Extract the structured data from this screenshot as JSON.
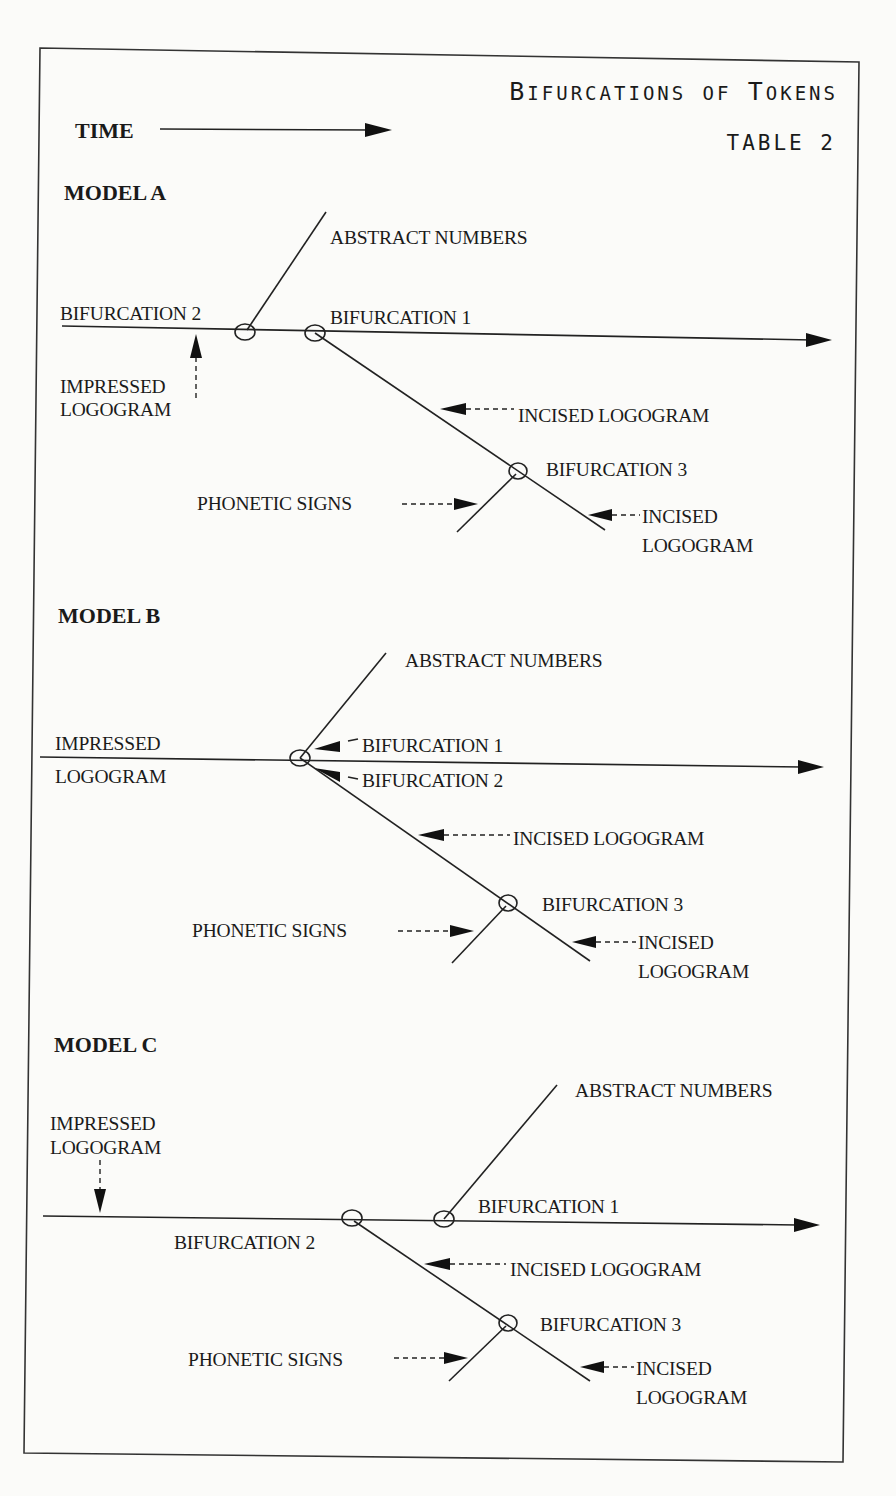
{
  "title": {
    "main": "Bifurcations of Tokens",
    "table": "TABLE 2"
  },
  "time_label": "TIME",
  "colors": {
    "ink": "#1a1a1a",
    "paper": "#fbfbf9"
  },
  "models": [
    {
      "name": "MODEL A",
      "labels": {
        "abstract": "ABSTRACT NUMBERS",
        "bif2": "BIFURCATION 2",
        "bif1": "BIFURCATION 1",
        "impressed_1": "IMPRESSED",
        "impressed_2": "LOGOGRAM",
        "incised": "INCISED LOGOGRAM",
        "bif3": "BIFURCATION 3",
        "phonetic": "PHONETIC SIGNS",
        "incised2_1": "INCISED",
        "incised2_2": "LOGOGRAM"
      }
    },
    {
      "name": "MODEL B",
      "labels": {
        "abstract": "ABSTRACT NUMBERS",
        "impressed_1": "IMPRESSED",
        "impressed_2": "LOGOGRAM",
        "bif1": "BIFURCATION 1",
        "bif2": "BIFURCATION 2",
        "incised": "INCISED LOGOGRAM",
        "bif3": "BIFURCATION 3",
        "phonetic": "PHONETIC SIGNS",
        "incised2_1": "INCISED",
        "incised2_2": "LOGOGRAM"
      }
    },
    {
      "name": "MODEL C",
      "labels": {
        "abstract": "ABSTRACT NUMBERS",
        "impressed_1": "IMPRESSED",
        "impressed_2": "LOGOGRAM",
        "bif1": "BIFURCATION 1",
        "bif2": "BIFURCATION 2",
        "incised": "INCISED LOGOGRAM",
        "bif3": "BIFURCATION 3",
        "phonetic": "PHONETIC SIGNS",
        "incised2_1": "INCISED",
        "incised2_2": "LOGOGRAM"
      }
    }
  ]
}
